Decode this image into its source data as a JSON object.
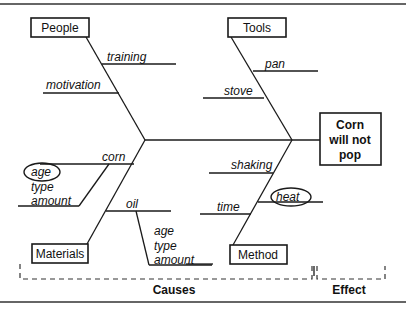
{
  "diagram": {
    "type": "fishbone",
    "effect": {
      "lines": [
        "Corn",
        "will not",
        "pop"
      ]
    },
    "categories": {
      "people": {
        "label": "People",
        "causes": [
          "training",
          "motivation"
        ]
      },
      "tools": {
        "label": "Tools",
        "causes": [
          "pan",
          "stove"
        ]
      },
      "materials": {
        "label": "Materials",
        "causes": [
          "corn",
          "oil"
        ],
        "corn_sub": [
          "age",
          "type",
          "amount"
        ],
        "oil_sub": [
          "age",
          "type",
          "amount"
        ]
      },
      "method": {
        "label": "Method",
        "causes": [
          "shaking",
          "time",
          "heat"
        ]
      }
    },
    "highlighted": [
      "age",
      "heat"
    ],
    "footer": {
      "causes_label": "Causes",
      "effect_label": "Effect"
    }
  }
}
